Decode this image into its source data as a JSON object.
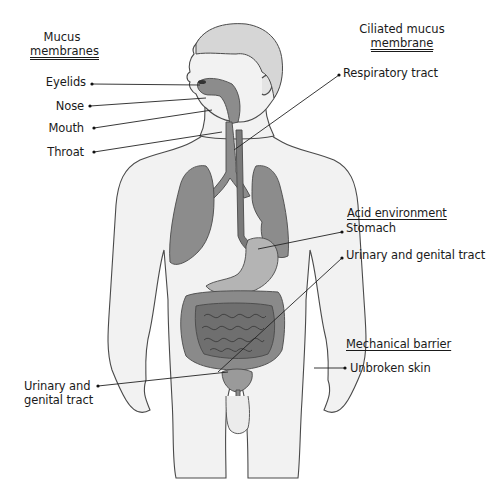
{
  "diagram": {
    "colors": {
      "skin_fill": "#f2f2f2",
      "outline": "#4a4a4a",
      "organ_fill": "#8c8c8c",
      "organ_dark": "#6e6e6e",
      "leader_line": "#222222"
    }
  },
  "groups": [
    {
      "id": "mucus-membranes",
      "heading_line1": "Mucus",
      "heading_line2": "membranes",
      "items": [
        "Eyelids",
        "Nose",
        "Mouth",
        "Throat"
      ]
    },
    {
      "id": "ciliated-mucus-membrane",
      "heading_line1": "Ciliated mucus",
      "heading_line2": "membrane",
      "items": [
        "Respiratory tract"
      ]
    },
    {
      "id": "acid-environment",
      "heading": "Acid environment",
      "items": [
        "Stomach",
        "Urinary and genital tract"
      ]
    },
    {
      "id": "mechanical-barrier",
      "heading": "Mechanical barrier",
      "items": [
        "Unbroken skin"
      ]
    }
  ],
  "left_bottom_label": {
    "line1": "Urinary and",
    "line2": "genital tract"
  }
}
